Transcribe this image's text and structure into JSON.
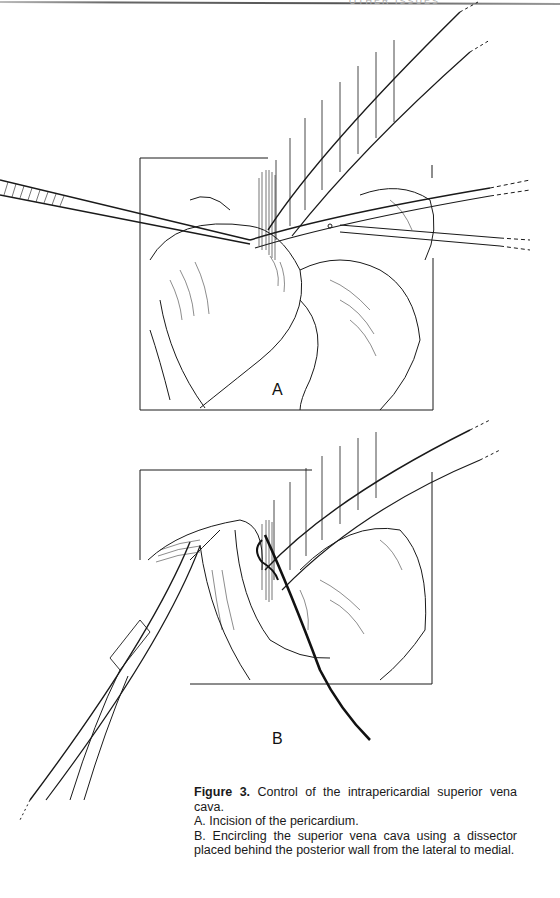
{
  "page": {
    "running_head": "OTHER ISSUES"
  },
  "figure": {
    "panels": [
      {
        "id": "A",
        "label": "A",
        "description": "Incision of the pericardium — forceps and scissors opening pericardium beside retracted superior vena cava"
      },
      {
        "id": "B",
        "label": "B",
        "description": "Dissector passed behind superior vena cava with encircling tape"
      }
    ],
    "caption": {
      "figure_number": "Figure 3.",
      "title": "Control of the intrapericardial superior vena cava.",
      "items": [
        "A. Incision of the pericardium.",
        "B. Encircling the superior vena cava using a dissector placed behind the posterior wall from the lateral to medial."
      ]
    }
  },
  "colors": {
    "ink": "#1a1a1a",
    "paper": "#ffffff"
  }
}
